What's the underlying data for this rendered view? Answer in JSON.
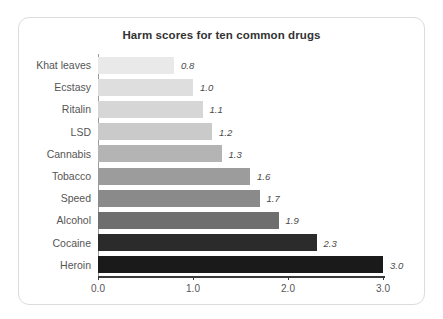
{
  "card": {
    "background": "#ffffff",
    "border_color": "#dcdcdc"
  },
  "chart_data": {
    "type": "bar",
    "orientation": "horizontal",
    "title": "Harm scores for ten common drugs",
    "xlabel": "",
    "ylabel": "",
    "categories": [
      "Khat leaves",
      "Ecstasy",
      "Ritalin",
      "LSD",
      "Cannabis",
      "Tobacco",
      "Speed",
      "Alcohol",
      "Cocaine",
      "Heroin"
    ],
    "values": [
      0.8,
      1.0,
      1.1,
      1.2,
      1.3,
      1.6,
      1.7,
      1.9,
      2.3,
      3.0
    ],
    "value_labels": [
      "0.8",
      "1.0",
      "1.1",
      "1.2",
      "1.3",
      "1.6",
      "1.7",
      "1.9",
      "2.3",
      "3.0"
    ],
    "bar_colors": [
      "#e9e9e9",
      "#dedede",
      "#d6d6d6",
      "#cacaca",
      "#b4b4b4",
      "#9c9c9c",
      "#8a8a8a",
      "#6e6e6e",
      "#2b2b2b",
      "#1a1a1a"
    ],
    "xlim": [
      0.0,
      3.0
    ],
    "xticks": [
      0.0,
      1.0,
      2.0,
      3.0
    ],
    "xtick_labels": [
      "0.0",
      "1.0",
      "2.0",
      "3.0"
    ],
    "grid": false,
    "legend": null,
    "axis_color": "#3a3a3a",
    "label_color": "#555555",
    "title_color": "#333333"
  }
}
